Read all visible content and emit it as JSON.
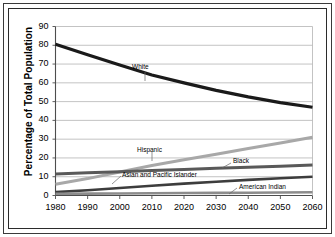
{
  "chart_data": {
    "type": "line",
    "title": "",
    "xlabel": "",
    "ylabel": "Percentage of Total Population",
    "x": [
      1980,
      1990,
      2000,
      2010,
      2020,
      2030,
      2040,
      2050,
      2060
    ],
    "xlim": [
      1980,
      2060
    ],
    "ylim": [
      0,
      90
    ],
    "ytick_labels": [
      "0",
      "10",
      "20",
      "30",
      "40",
      "50",
      "60",
      "70",
      "80",
      "90"
    ],
    "yticks": [
      0,
      10,
      20,
      30,
      40,
      50,
      60,
      70,
      80,
      90
    ],
    "xtick_labels": [
      "1980",
      "1990",
      "2000",
      "2010",
      "2020",
      "2030",
      "2040",
      "2050",
      "2060"
    ],
    "grid": "horizontal",
    "legend_position": "inline-labels",
    "series": [
      {
        "name": "White",
        "color": "#1a1a1a",
        "width": 3.2,
        "values": [
          80.5,
          75.0,
          69.5,
          64.2,
          60.0,
          56.0,
          52.5,
          49.5,
          47.0
        ],
        "label": "White",
        "label_x": 132,
        "label_y": 63,
        "leader": {
          "x1": 145,
          "y1": 72,
          "x2": 145,
          "y2": 81
        }
      },
      {
        "name": "Hispanic",
        "color": "#a8a8a8",
        "width": 3.0,
        "values": [
          6.0,
          9.0,
          12.5,
          16.0,
          19.0,
          22.0,
          25.0,
          28.0,
          31.0
        ],
        "label": "Hispanic",
        "label_x": 137,
        "label_y": 146,
        "leader": {
          "x1": 152,
          "y1": 152,
          "x2": 152,
          "y2": 161
        }
      },
      {
        "name": "Black",
        "color": "#595959",
        "width": 3.0,
        "values": [
          11.5,
          12.1,
          12.7,
          13.3,
          13.9,
          14.5,
          15.0,
          15.6,
          16.2
        ],
        "label": "Black",
        "label_x": 233,
        "label_y": 157,
        "leader": {
          "x1": 231,
          "y1": 163,
          "x2": 222,
          "y2": 168
        }
      },
      {
        "name": "Asian and Pacific Islander",
        "color": "#3d3d3d",
        "width": 2.6,
        "values": [
          1.8,
          2.8,
          4.0,
          5.2,
          6.3,
          7.3,
          8.3,
          9.2,
          10.0
        ],
        "label": "Asian and Pacific Islander",
        "label_x": 122,
        "label_y": 171,
        "leader": {
          "x1": 121,
          "y1": 176,
          "x2": 112,
          "y2": 184
        }
      },
      {
        "name": "American Indian",
        "color": "#8c8c8c",
        "width": 2.6,
        "values": [
          0.9,
          1.0,
          1.1,
          1.2,
          1.3,
          1.4,
          1.5,
          1.6,
          1.7
        ],
        "label": "American Indian",
        "label_x": 239,
        "label_y": 183,
        "leader": {
          "x1": 237,
          "y1": 188,
          "x2": 229,
          "y2": 194
        }
      }
    ],
    "colors": {
      "frame": "#2b2b2b",
      "grid": "#b4b4b4",
      "axis": "#4d4d4d",
      "background": "#ffffff"
    }
  }
}
